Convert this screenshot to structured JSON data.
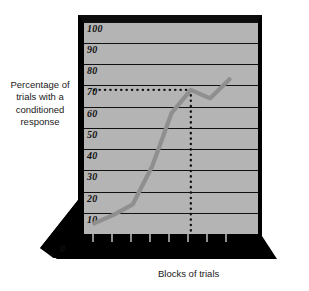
{
  "figure": {
    "y_axis_title": "Percentage of trials with a conditioned response",
    "x_axis_title": "Blocks of trials",
    "zero_label": "0"
  },
  "chart_data": {
    "type": "line",
    "title": "",
    "xlabel": "Blocks of trials",
    "ylabel": "Percentage of trials with a conditioned response",
    "x": [
      1,
      2,
      3,
      4,
      5,
      6,
      7,
      8
    ],
    "categories": [
      "1",
      "2",
      "3",
      "4",
      "5",
      "6",
      "7",
      "8"
    ],
    "values": [
      5,
      9,
      14,
      32,
      57,
      68,
      64,
      73
    ],
    "series": [
      {
        "name": "Conditioned response",
        "values": [
          5,
          9,
          14,
          32,
          57,
          68,
          64,
          73
        ],
        "color": "#8f8f8f"
      }
    ],
    "ylim": [
      0,
      100
    ],
    "ytick_labels": [
      "0",
      "10",
      "20",
      "30",
      "40",
      "50",
      "60",
      "70",
      "80",
      "90",
      "100"
    ],
    "ytick_values": [
      0,
      10,
      20,
      30,
      40,
      50,
      60,
      70,
      80,
      90,
      100
    ],
    "xtick_labels": [
      "",
      "",
      "",
      "",
      "",
      "",
      "",
      ""
    ],
    "grid": true,
    "legend": "none",
    "annotations": [
      {
        "name": "asymptote-reference",
        "type": "dotted-horizontal",
        "y": 68,
        "x_from": 1,
        "x_to": 6,
        "label": ""
      },
      {
        "name": "asymptote-block-marker",
        "type": "dotted-vertical",
        "x": 6,
        "y_from": 0,
        "y_to": 68,
        "label": ""
      }
    ],
    "plot_bgcolor": "#b4b4b4",
    "frame_color": "#000000",
    "line_color": "#8f8f8f",
    "gridline_color": "#111111"
  }
}
